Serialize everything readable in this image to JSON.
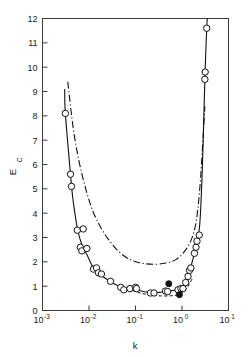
{
  "chart_data": {
    "type": "scatter",
    "title": "",
    "xlabel": "k",
    "ylabel": "Ec",
    "ylabel_base": "E",
    "ylabel_sub": "C",
    "xscale": "log",
    "yscale": "linear",
    "xlim": [
      0.001,
      10
    ],
    "ylim": [
      0,
      12
    ],
    "grid": false,
    "legend": "none",
    "x_ticks": [
      0.001,
      0.01,
      0.1,
      1,
      10
    ],
    "x_tick_labels": [
      "10-3",
      "10-2",
      "10-1",
      "100",
      "101"
    ],
    "x_tick_mantissa": [
      "10",
      "10",
      "10",
      "10",
      "10"
    ],
    "x_tick_exponents": [
      "-3",
      "-2",
      "-1",
      "0",
      "1"
    ],
    "y_ticks": [
      0,
      1,
      2,
      3,
      4,
      5,
      6,
      7,
      8,
      9,
      10,
      11,
      12
    ],
    "y_tick_labels": [
      "0",
      "1",
      "2",
      "3",
      "4",
      "5",
      "6",
      "7",
      "8",
      "9",
      "10",
      "11",
      "12"
    ],
    "series": [
      {
        "name": "open-circle-data",
        "marker": "open-circle",
        "points": [
          {
            "x": 0.0031,
            "y": 8.1
          },
          {
            "x": 0.004,
            "y": 5.6
          },
          {
            "x": 0.0042,
            "y": 5.1
          },
          {
            "x": 0.0056,
            "y": 3.3
          },
          {
            "x": 0.0075,
            "y": 3.35
          },
          {
            "x": 0.0065,
            "y": 2.6
          },
          {
            "x": 0.007,
            "y": 2.45
          },
          {
            "x": 0.009,
            "y": 2.55
          },
          {
            "x": 0.0125,
            "y": 1.7
          },
          {
            "x": 0.0145,
            "y": 1.75
          },
          {
            "x": 0.016,
            "y": 1.55
          },
          {
            "x": 0.0185,
            "y": 1.5
          },
          {
            "x": 0.029,
            "y": 1.2
          },
          {
            "x": 0.048,
            "y": 0.95
          },
          {
            "x": 0.056,
            "y": 0.85
          },
          {
            "x": 0.076,
            "y": 0.9
          },
          {
            "x": 0.1,
            "y": 0.95
          },
          {
            "x": 0.105,
            "y": 0.9
          },
          {
            "x": 0.21,
            "y": 0.72
          },
          {
            "x": 0.25,
            "y": 0.72
          },
          {
            "x": 0.44,
            "y": 0.8
          },
          {
            "x": 0.49,
            "y": 0.78
          },
          {
            "x": 0.82,
            "y": 0.85
          },
          {
            "x": 0.95,
            "y": 0.9
          },
          {
            "x": 1.05,
            "y": 0.9
          },
          {
            "x": 1.2,
            "y": 1.15
          },
          {
            "x": 1.35,
            "y": 1.4
          },
          {
            "x": 1.45,
            "y": 1.65
          },
          {
            "x": 1.55,
            "y": 1.75
          },
          {
            "x": 1.85,
            "y": 2.35
          },
          {
            "x": 2.0,
            "y": 2.6
          },
          {
            "x": 2.1,
            "y": 2.85
          },
          {
            "x": 2.35,
            "y": 3.1
          },
          {
            "x": 3.1,
            "y": 9.5
          },
          {
            "x": 3.15,
            "y": 9.8
          },
          {
            "x": 3.4,
            "y": 11.6
          }
        ]
      },
      {
        "name": "filled-circle-data",
        "marker": "filled-circle",
        "points": [
          {
            "x": 0.52,
            "y": 1.1
          },
          {
            "x": 0.88,
            "y": 0.65
          }
        ]
      }
    ],
    "curves": [
      {
        "name": "solid-fit-curve",
        "style": "solid",
        "points": [
          {
            "x": 0.003,
            "y": 9.1
          },
          {
            "x": 0.0031,
            "y": 8.1
          },
          {
            "x": 0.004,
            "y": 5.6
          },
          {
            "x": 0.0045,
            "y": 4.6
          },
          {
            "x": 0.0056,
            "y": 3.4
          },
          {
            "x": 0.007,
            "y": 2.7
          },
          {
            "x": 0.009,
            "y": 2.3
          },
          {
            "x": 0.0125,
            "y": 1.75
          },
          {
            "x": 0.0185,
            "y": 1.45
          },
          {
            "x": 0.029,
            "y": 1.18
          },
          {
            "x": 0.048,
            "y": 0.97
          },
          {
            "x": 0.076,
            "y": 0.9
          },
          {
            "x": 0.12,
            "y": 0.82
          },
          {
            "x": 0.21,
            "y": 0.73
          },
          {
            "x": 0.35,
            "y": 0.75
          },
          {
            "x": 0.52,
            "y": 0.8
          },
          {
            "x": 0.82,
            "y": 0.85
          },
          {
            "x": 1.05,
            "y": 0.95
          },
          {
            "x": 1.35,
            "y": 1.4
          },
          {
            "x": 1.55,
            "y": 1.8
          },
          {
            "x": 1.85,
            "y": 2.35
          },
          {
            "x": 2.1,
            "y": 2.85
          },
          {
            "x": 2.4,
            "y": 3.5
          },
          {
            "x": 2.7,
            "y": 5.5
          },
          {
            "x": 2.95,
            "y": 8.0
          },
          {
            "x": 3.15,
            "y": 9.9
          },
          {
            "x": 3.4,
            "y": 11.6
          },
          {
            "x": 3.5,
            "y": 12.0
          }
        ]
      },
      {
        "name": "dash-dot-theory-curve",
        "style": "dash-dot",
        "points": [
          {
            "x": 0.0035,
            "y": 9.4
          },
          {
            "x": 0.0045,
            "y": 7.6
          },
          {
            "x": 0.006,
            "y": 6.2
          },
          {
            "x": 0.0085,
            "y": 5.0
          },
          {
            "x": 0.012,
            "y": 4.1
          },
          {
            "x": 0.018,
            "y": 3.4
          },
          {
            "x": 0.028,
            "y": 2.85
          },
          {
            "x": 0.045,
            "y": 2.4
          },
          {
            "x": 0.075,
            "y": 2.1
          },
          {
            "x": 0.13,
            "y": 1.95
          },
          {
            "x": 0.25,
            "y": 1.9
          },
          {
            "x": 0.45,
            "y": 1.95
          },
          {
            "x": 0.75,
            "y": 2.1
          },
          {
            "x": 1.1,
            "y": 2.4
          },
          {
            "x": 1.5,
            "y": 2.8
          },
          {
            "x": 1.9,
            "y": 3.4
          },
          {
            "x": 2.2,
            "y": 4.2
          },
          {
            "x": 2.5,
            "y": 5.4
          },
          {
            "x": 2.8,
            "y": 6.9
          },
          {
            "x": 3.1,
            "y": 8.4
          }
        ]
      },
      {
        "name": "dashed-lower-curve",
        "style": "dashed",
        "points": [
          {
            "x": 0.085,
            "y": 0.82
          },
          {
            "x": 0.14,
            "y": 0.7
          },
          {
            "x": 0.22,
            "y": 0.63
          },
          {
            "x": 0.35,
            "y": 0.6
          },
          {
            "x": 0.52,
            "y": 0.6
          },
          {
            "x": 0.7,
            "y": 0.62
          },
          {
            "x": 0.88,
            "y": 0.68
          },
          {
            "x": 1.1,
            "y": 0.78
          },
          {
            "x": 1.3,
            "y": 0.95
          },
          {
            "x": 1.5,
            "y": 1.15
          },
          {
            "x": 1.65,
            "y": 1.3
          }
        ]
      }
    ]
  }
}
